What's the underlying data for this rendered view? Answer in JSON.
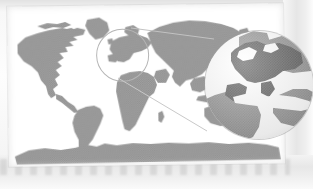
{
  "figure": {
    "kind": "world-map-with-magnifier-callout",
    "title": "",
    "caption": "",
    "orientation": "landscape",
    "rotation_deg": -0.7,
    "size": {
      "width": 313,
      "height": 189
    }
  },
  "colors": {
    "page_background": "#f1f1f1",
    "map_panel": "#ffffff",
    "ocean": "#ffffff",
    "land": "#9d9d9d",
    "land_halftone_dot": "#8a8a8a",
    "highlight_region": "#4a4a4a",
    "lens_outline": "#a8a8a8",
    "connector_line": "#bdbdbd",
    "frame_band": "#e6e6e6"
  },
  "map": {
    "projection": "equirectangular",
    "panel": {
      "x": 8,
      "y": 5,
      "width": 276,
      "height": 160
    },
    "landmasses": [
      {
        "name": "north-america"
      },
      {
        "name": "greenland"
      },
      {
        "name": "south-america"
      },
      {
        "name": "africa"
      },
      {
        "name": "europe"
      },
      {
        "name": "asia"
      },
      {
        "name": "australia"
      },
      {
        "name": "antarctica"
      }
    ]
  },
  "callout": {
    "source_circle": {
      "cx": 123,
      "cy": 55,
      "r": 25,
      "region": "europe"
    },
    "lens_circle": {
      "cx": 259,
      "cy": 85,
      "r": 54
    },
    "connector_lines": 2,
    "magnified_region": "europe-and-mediterranean",
    "highlight_label": ""
  },
  "legend": {
    "entries": []
  },
  "labels": []
}
